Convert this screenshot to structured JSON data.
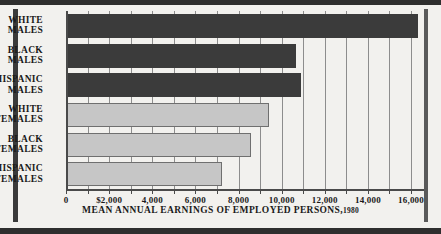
{
  "chart_data": {
    "type": "bar",
    "orientation": "horizontal",
    "title_main": "MEAN ANNUAL EARNINGS OF EMPLOYED PERSONS,",
    "title_year": "1980",
    "xlabel": "",
    "ylabel": "",
    "xlim": [
      0,
      16600
    ],
    "grid": true,
    "gridline_interval": 1000,
    "legend": "none",
    "categories": [
      "WHITE\nMALES",
      "BLACK\nMALES",
      "HISPANIC\nMALES",
      "WHITE\nFEMALES",
      "BLACK\nFEMALES",
      "HISPANIC\nFEMALES"
    ],
    "values": [
      16300,
      10650,
      10900,
      9400,
      8600,
      7250
    ],
    "bar_styles": [
      "dark",
      "dark",
      "dark",
      "light",
      "light",
      "light"
    ],
    "xticks": [
      0,
      1000,
      2000,
      3000,
      4000,
      5000,
      6000,
      7000,
      8000,
      9000,
      10000,
      11000,
      12000,
      13000,
      14000,
      15000,
      16000
    ],
    "xtick_labels": [
      {
        "value": 0,
        "label": "0"
      },
      {
        "value": 2000,
        "label": "$2,000"
      },
      {
        "value": 4000,
        "label": "4,000"
      },
      {
        "value": 6000,
        "label": "6,000"
      },
      {
        "value": 8000,
        "label": "8,000"
      },
      {
        "value": 10000,
        "label": "10,000"
      },
      {
        "value": 12000,
        "label": "12,000"
      },
      {
        "value": 14000,
        "label": "14,000"
      },
      {
        "value": 16000,
        "label": "16,000"
      }
    ],
    "colors": {
      "bar_dark": "#3b3b3b",
      "bar_light": "#c6c6c6",
      "bar_light_border": "#6f6f6f",
      "gridline": "#8d8d8d",
      "axis": "#4a4a4a",
      "frame": "#2e2e2e",
      "background": "#f2f1ee",
      "text": "#1a1a1a"
    }
  }
}
